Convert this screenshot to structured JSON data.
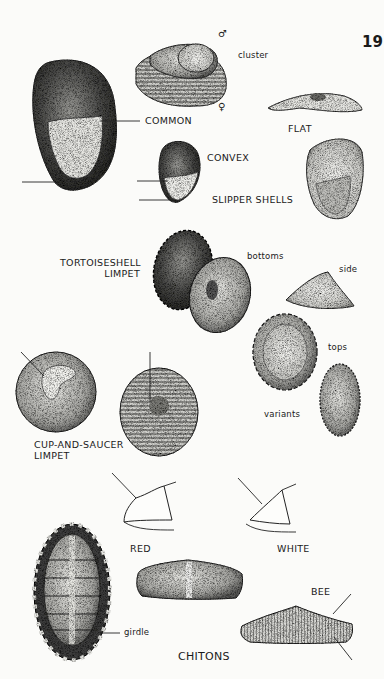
{
  "page": {
    "page_number": "19",
    "sections": [
      {
        "title": "SLIPPER SHELLS",
        "labels": {
          "common": "COMMON",
          "convex": "CONVEX",
          "flat": "FLAT",
          "cluster": "cluster",
          "male_symbol": "♂",
          "female_symbol": "♀"
        }
      },
      {
        "title": "TORTOISESHELL LIMPET",
        "title_lines": [
          "TORTOISESHELL",
          "LIMPET"
        ],
        "labels": {
          "bottoms": "bottoms",
          "side": "side",
          "tops": "tops",
          "variants": "variants"
        }
      },
      {
        "title": "CUP-AND-SAUCER LIMPET",
        "title_lines": [
          "CUP-AND-SAUCER",
          "LIMPET"
        ]
      },
      {
        "title": "CHITONS",
        "labels": {
          "red": "RED",
          "white": "WHITE",
          "bee": "BEE",
          "girdle": "girdle"
        }
      }
    ]
  }
}
